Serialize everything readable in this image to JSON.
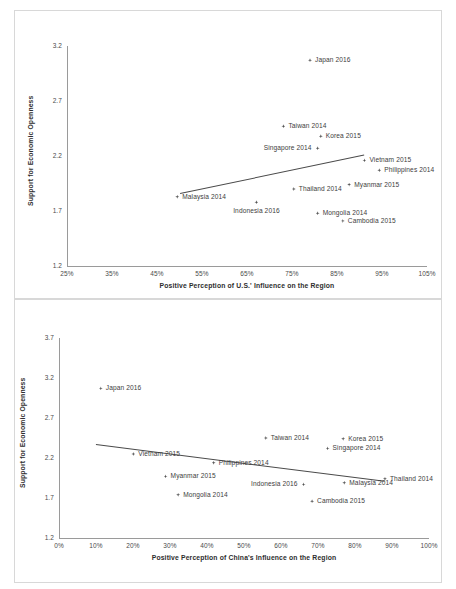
{
  "chart_data": [
    {
      "type": "scatter",
      "id": "us-influence",
      "title": "",
      "xlabel": "Positive Perception of U.S.' Influence on the Region",
      "ylabel": "Support for Economic Openness",
      "xlim": [
        25,
        105
      ],
      "ylim": [
        1.2,
        3.2
      ],
      "xticks": [
        "25%",
        "35%",
        "45%",
        "55%",
        "65%",
        "75%",
        "85%",
        "95%",
        "105%"
      ],
      "xtick_values": [
        25,
        35,
        45,
        55,
        65,
        75,
        85,
        95,
        105
      ],
      "yticks": [
        "1.2",
        "1.7",
        "2.2",
        "2.7",
        "3.2"
      ],
      "ytick_values": [
        1.2,
        1.7,
        2.2,
        2.7,
        3.2
      ],
      "grid": false,
      "legend": "none",
      "trendline": {
        "x0": 50.0,
        "y0": 1.86,
        "x1": 91.0,
        "y1": 2.21
      },
      "points": [
        {
          "label": "Japan 2016",
          "x": 79.0,
          "y": 3.07,
          "label_pos": "right"
        },
        {
          "label": "Taiwan 2014",
          "x": 73.1,
          "y": 2.47,
          "label_pos": "right"
        },
        {
          "label": "Korea 2015",
          "x": 81.4,
          "y": 2.38,
          "label_pos": "right"
        },
        {
          "label": "Singapore 2014",
          "x": 80.7,
          "y": 2.27,
          "label_pos": "left"
        },
        {
          "label": "Vietnam 2015",
          "x": 91.1,
          "y": 2.16,
          "label_pos": "right"
        },
        {
          "label": "Philippines 2014",
          "x": 94.4,
          "y": 2.07,
          "label_pos": "right"
        },
        {
          "label": "Myanmar 2015",
          "x": 87.7,
          "y": 1.94,
          "label_pos": "right"
        },
        {
          "label": "Thailand 2014",
          "x": 75.4,
          "y": 1.9,
          "label_pos": "right"
        },
        {
          "label": "Malaysia 2014",
          "x": 49.5,
          "y": 1.83,
          "label_pos": "right"
        },
        {
          "label": "Indonesia 2016",
          "x": 67.1,
          "y": 1.78,
          "label_pos": "below"
        },
        {
          "label": "Mongolia 2014",
          "x": 80.7,
          "y": 1.68,
          "label_pos": "right"
        },
        {
          "label": "Cambodia 2015",
          "x": 86.3,
          "y": 1.61,
          "label_pos": "right"
        }
      ]
    },
    {
      "type": "scatter",
      "id": "china-influence",
      "title": "",
      "xlabel": "Positive Perception of China's Influence on the Region",
      "ylabel": "Support for Economic Openness",
      "xlim": [
        0,
        100
      ],
      "ylim": [
        1.2,
        3.7
      ],
      "xticks": [
        "0%",
        "10%",
        "20%",
        "30%",
        "40%",
        "50%",
        "60%",
        "70%",
        "80%",
        "90%",
        "100%"
      ],
      "xtick_values": [
        0,
        10,
        20,
        30,
        40,
        50,
        60,
        70,
        80,
        90,
        100
      ],
      "yticks": [
        "1.2",
        "1.7",
        "2.2",
        "2.7",
        "3.2",
        "3.7"
      ],
      "ytick_values": [
        1.2,
        1.7,
        2.2,
        2.7,
        3.2,
        3.7
      ],
      "grid": false,
      "legend": "none",
      "trendline": {
        "x0": 10.0,
        "y0": 2.38,
        "x1": 88.0,
        "y1": 1.92
      },
      "points": [
        {
          "label": "Japan 2016",
          "x": 11.3,
          "y": 3.07,
          "label_pos": "right"
        },
        {
          "label": "Taiwan 2014",
          "x": 55.9,
          "y": 2.45,
          "label_pos": "right"
        },
        {
          "label": "Korea 2015",
          "x": 76.8,
          "y": 2.44,
          "label_pos": "right"
        },
        {
          "label": "Singapore 2014",
          "x": 72.6,
          "y": 2.32,
          "label_pos": "right"
        },
        {
          "label": "Vietnam 2015",
          "x": 20.1,
          "y": 2.25,
          "label_pos": "right"
        },
        {
          "label": "Philippines 2014",
          "x": 41.8,
          "y": 2.14,
          "label_pos": "right"
        },
        {
          "label": "Myanmar 2015",
          "x": 28.8,
          "y": 1.97,
          "label_pos": "right"
        },
        {
          "label": "Thailand 2014",
          "x": 88.1,
          "y": 1.94,
          "label_pos": "right"
        },
        {
          "label": "Malaysia 2014",
          "x": 77.1,
          "y": 1.89,
          "label_pos": "right"
        },
        {
          "label": "Indonesia 2016",
          "x": 66.1,
          "y": 1.87,
          "label_pos": "left"
        },
        {
          "label": "Mongolia 2014",
          "x": 32.2,
          "y": 1.74,
          "label_pos": "right"
        },
        {
          "label": "Cambodia 2015",
          "x": 68.4,
          "y": 1.66,
          "label_pos": "right"
        }
      ]
    }
  ]
}
